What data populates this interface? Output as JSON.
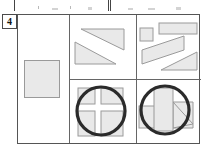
{
  "figure": {
    "index_label": "4",
    "caption": "",
    "background": "#ffffff",
    "frame_color": "#555555",
    "shape_fill": "#e9e9e9",
    "shape_stroke": "#9a9a9a",
    "circle_stroke": "#2b2b2b"
  },
  "top_strip": {
    "name": "cropped-panels-above",
    "panels": [
      {
        "label": "",
        "x": 14,
        "width": 93
      },
      {
        "label": "",
        "x": 110,
        "width": 90
      }
    ]
  },
  "panel": {
    "name": "shape-grid-panel",
    "cells": [
      {
        "id": "left",
        "name": "left-cell",
        "shapes": [
          {
            "name": "square",
            "type": "rect",
            "x": 6,
            "y": 45,
            "w": 36,
            "h": 38
          }
        ]
      },
      {
        "id": "top-middle",
        "name": "top-middle-cell",
        "shapes": [
          {
            "name": "triangle-upper",
            "type": "triangle",
            "points": "11,14 54,14 54,35"
          },
          {
            "name": "triangle-lower",
            "type": "triangle",
            "points": "5,27 5,49 46,49"
          }
        ]
      },
      {
        "id": "top-right",
        "name": "top-right-cell",
        "shapes": [
          {
            "name": "small-square",
            "type": "rect",
            "x": 3,
            "y": 13,
            "w": 13,
            "h": 13
          },
          {
            "name": "wide-rectangle",
            "type": "rect",
            "x": 22,
            "y": 8,
            "w": 38,
            "h": 11
          },
          {
            "name": "slanted-band",
            "type": "parallelogram",
            "points": "5,35 47,21 47,35 5,49"
          },
          {
            "name": "triangle-lower-right",
            "type": "triangle",
            "points": "24,55 60,55 60,37"
          }
        ]
      },
      {
        "id": "bottom-middle",
        "name": "bottom-middle-cell",
        "shapes": [
          {
            "name": "square-with-cross-cutout",
            "type": "rect",
            "x": 8,
            "y": 8,
            "w": 45,
            "h": 48
          },
          {
            "name": "cross-notch-top-left",
            "type": "cutout",
            "x": 8,
            "y": 8,
            "w": 17,
            "h": 16
          },
          {
            "name": "cross-notch-top-right",
            "type": "cutout",
            "x": 31,
            "y": 8,
            "w": 22,
            "h": 16
          },
          {
            "name": "cross-notch-bottom-left",
            "type": "cutout",
            "x": 8,
            "y": 31,
            "w": 17,
            "h": 25
          },
          {
            "name": "cross-notch-bottom-right",
            "type": "cutout",
            "x": 31,
            "y": 31,
            "w": 22,
            "h": 25
          },
          {
            "name": "circle-outline",
            "type": "circle",
            "cx": 31,
            "cy": 31,
            "r": 24
          }
        ]
      },
      {
        "id": "bottom-right",
        "name": "bottom-right-cell",
        "shapes": [
          {
            "name": "left-rectangle",
            "type": "rect",
            "x": 2,
            "y": 26,
            "w": 24,
            "h": 22
          },
          {
            "name": "vertical-rectangle",
            "type": "rect",
            "x": 17,
            "y": 8,
            "w": 19,
            "h": 43
          },
          {
            "name": "triangle-right",
            "type": "triangle",
            "points": "36,22 56,22 56,48 36,48"
          },
          {
            "name": "circle-outline",
            "type": "circle",
            "cx": 28,
            "cy": 30,
            "r": 24
          }
        ]
      }
    ]
  }
}
